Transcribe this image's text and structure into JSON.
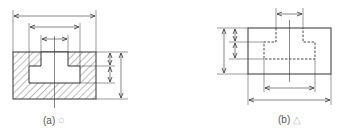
{
  "figure_a": {
    "label": "(a)",
    "mark_icon": "circle-icon",
    "mark": "○",
    "description": "Section view with hatched body and T-shaped cavity; dimensions from outer edges"
  },
  "figure_b": {
    "label": "(b)",
    "mark_icon": "triangle-icon",
    "mark": "△",
    "description": "Outline view with hidden (dashed) T-shaped cavity; dimensions to hidden lines"
  },
  "colors": {
    "line": "#333333",
    "hatch": "#555555",
    "caption": "#555555",
    "mark": "#bbbbbb"
  }
}
